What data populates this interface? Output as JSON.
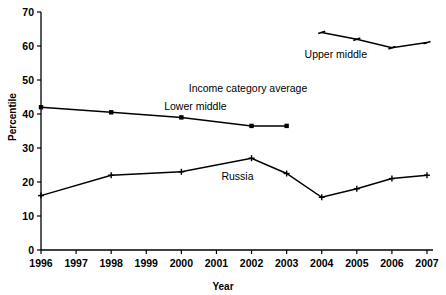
{
  "chart_data": {
    "type": "line",
    "title": "",
    "xlabel": "Year",
    "ylabel": "Percentile",
    "xlim": [
      1996,
      2007
    ],
    "ylim": [
      0,
      70
    ],
    "ytick_step": 10,
    "grid": false,
    "legend_position": "inline-annotations",
    "xticks": [
      "1996",
      "1997",
      "1998",
      "1999",
      "2000",
      "2001",
      "2002",
      "2003",
      "2004",
      "2005",
      "2006",
      "2007"
    ],
    "yticks": [
      "0",
      "10",
      "20",
      "30",
      "40",
      "50",
      "60",
      "70"
    ],
    "annotations": [
      {
        "text": "Upper middle",
        "x": 2004.4,
        "y": 57.5
      },
      {
        "text": "Income category average",
        "x": 2001.9,
        "y": 47.5
      },
      {
        "text": "Lower middle",
        "x": 2000.4,
        "y": 42.0
      },
      {
        "text": "Russia",
        "x": 2001.6,
        "y": 21.5
      }
    ],
    "series": [
      {
        "name": "Upper middle",
        "marker": "dash",
        "x": [
          2004,
          2005,
          2006,
          2007
        ],
        "values": [
          64.0,
          62.0,
          59.5,
          61.0
        ]
      },
      {
        "name": "Income category average / Lower middle",
        "marker": "square",
        "x": [
          1996,
          1998,
          2000,
          2002,
          2003
        ],
        "values": [
          42.0,
          40.5,
          39.0,
          36.5,
          36.5
        ]
      },
      {
        "name": "Russia",
        "marker": "plus",
        "x": [
          1996,
          1998,
          2000,
          2002,
          2003,
          2004,
          2005,
          2006,
          2007
        ],
        "values": [
          16.0,
          22.0,
          23.0,
          27.0,
          22.5,
          15.5,
          18.0,
          21.0,
          22.0
        ]
      }
    ]
  }
}
